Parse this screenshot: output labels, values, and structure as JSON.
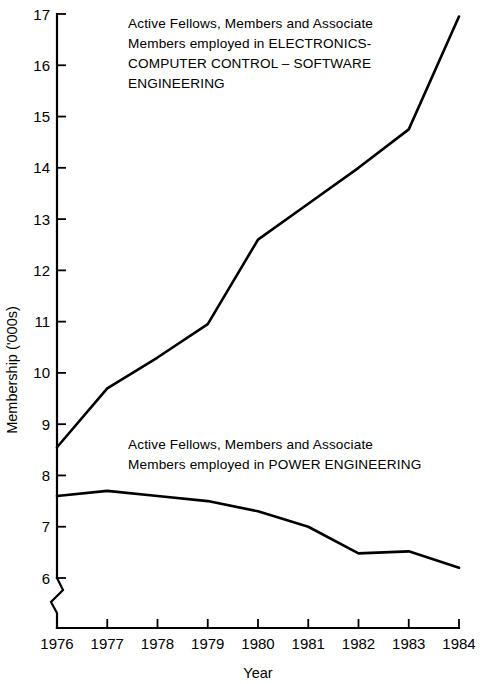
{
  "chart_data": {
    "type": "line",
    "title": "",
    "subtitle": "",
    "xlabel": "Year",
    "ylabel": "Membership ('000s)",
    "x": [
      1976,
      1977,
      1978,
      1979,
      1980,
      1981,
      1982,
      1983,
      1984
    ],
    "xtick_labels": [
      "1976",
      "1977",
      "1978",
      "1979",
      "1980",
      "1981",
      "1982",
      "1983",
      "1984"
    ],
    "ytick_labels": [
      "17",
      "16",
      "15",
      "14",
      "13",
      "12",
      "11",
      "10",
      "9",
      "8",
      "7",
      "6"
    ],
    "yticks": [
      17,
      16,
      15,
      14,
      13,
      12,
      11,
      10,
      9,
      8,
      7,
      6
    ],
    "xlim": [
      1976,
      1984
    ],
    "ylim": [
      6,
      17
    ],
    "grid": false,
    "legend_position": "inline-annotation",
    "axis_break": {
      "axis": "y",
      "below_value": 6,
      "style": "zigzag"
    },
    "series": [
      {
        "name": "Active Fellows, Members and Associate Members employed in ELECTRONICS-COMPUTER CONTROL-SOFTWARE ENGINEERING",
        "short_name": "electronics-computer-control-software",
        "color": "#000000",
        "values": [
          8.55,
          9.7,
          10.3,
          10.95,
          12.6,
          13.3,
          14.0,
          14.75,
          16.95
        ]
      },
      {
        "name": "Active Fellows, Members and Associate Members employed in POWER ENGINEERING",
        "short_name": "power-engineering",
        "color": "#000000",
        "values": [
          7.6,
          7.7,
          7.6,
          7.5,
          7.3,
          7.0,
          6.48,
          6.52,
          6.2
        ]
      }
    ],
    "annotations": [
      {
        "id": "electronics-label",
        "lines": [
          "Active Fellows, Members and Associate",
          "Members employed in ELECTRONICS-",
          "COMPUTER CONTROL – SOFTWARE",
          "ENGINEERING"
        ]
      },
      {
        "id": "power-label",
        "lines": [
          "Active Fellows, Members and Associate",
          "Members employed in  POWER  ENGINEERING"
        ]
      }
    ]
  },
  "axes": {
    "y_title": "Membership ('000s)",
    "x_title": "Year"
  },
  "ytick_text": {
    "t0": "17",
    "t1": "16",
    "t2": "15",
    "t3": "14",
    "t4": "13",
    "t5": "12",
    "t6": "11",
    "t7": "10",
    "t8": "9",
    "t9": "8",
    "t10": "7",
    "t11": "6"
  },
  "xtick_text": {
    "t0": "1976",
    "t1": "1977",
    "t2": "1978",
    "t3": "1979",
    "t4": "1980",
    "t5": "1981",
    "t6": "1982",
    "t7": "1983",
    "t8": "1984"
  },
  "annotation_electronics": {
    "line1": "Active Fellows, Members and Associate",
    "line2": "Members employed in ELECTRONICS-",
    "line3": "COMPUTER CONTROL – SOFTWARE",
    "line4": "ENGINEERING"
  },
  "annotation_power": {
    "line1": "Active Fellows, Members and Associate",
    "line2": "Members employed in  POWER  ENGINEERING"
  },
  "colors": {
    "ink": "#000000",
    "background": "#ffffff"
  }
}
